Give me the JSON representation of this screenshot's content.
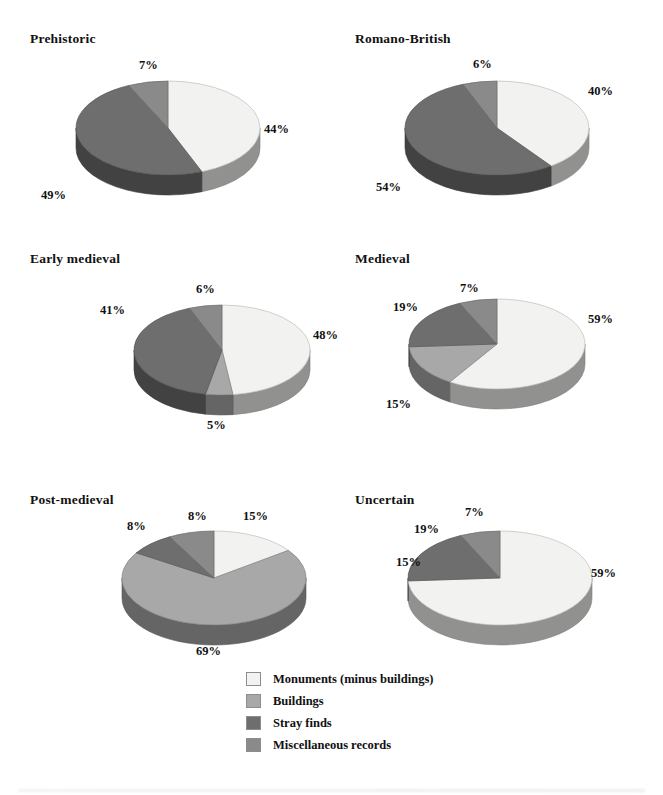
{
  "page": {
    "background": "#ffffff",
    "width": 663,
    "height": 795
  },
  "palette": {
    "monuments": "#f2f2f0",
    "buildings": "#a8a8a8",
    "stray_finds": "#6e6e6e",
    "misc_records": "#8a8a8a",
    "monuments_side": "#6e6e6e",
    "buildings_side": "#8a8a8a",
    "stray_finds_side": "#5a5a5a",
    "misc_side": "#6e6e6e",
    "outline": "#8d8d8d"
  },
  "legend": {
    "name": "chart-legend",
    "items": [
      {
        "label": "Monuments (minus buildings)",
        "color": "#f2f2f0",
        "key": "monuments"
      },
      {
        "label": "Buildings",
        "color": "#a8a8a8",
        "key": "buildings"
      },
      {
        "label": "Stray finds",
        "color": "#6e6e6e",
        "key": "stray_finds"
      },
      {
        "label": "Miscellaneous records",
        "color": "#8a8a8a",
        "key": "misc_records"
      }
    ]
  },
  "chart_data": [
    {
      "type": "pie",
      "title": "Prehistoric",
      "categories": [
        "Monuments (minus buildings)",
        "Buildings",
        "Stray finds",
        "Miscellaneous records"
      ],
      "values": [
        44,
        0,
        49,
        7
      ],
      "labels": [
        "44%",
        null,
        "49%",
        "7%"
      ],
      "legend_position": "bottom-center",
      "notes": "3-D pie, clockwise from 12 o'clock"
    },
    {
      "type": "pie",
      "title": "Romano-British",
      "categories": [
        "Monuments (minus buildings)",
        "Buildings",
        "Stray finds",
        "Miscellaneous records"
      ],
      "values": [
        40,
        0,
        54,
        6
      ],
      "labels": [
        "40%",
        null,
        "54%",
        "6%"
      ],
      "legend_position": "bottom-center",
      "notes": "3-D pie, clockwise from 12 o'clock"
    },
    {
      "type": "pie",
      "title": "Early medieval",
      "categories": [
        "Monuments (minus buildings)",
        "Buildings",
        "Stray finds",
        "Miscellaneous records"
      ],
      "values": [
        48,
        5,
        41,
        6
      ],
      "labels": [
        "48%",
        "5%",
        "41%",
        "6%"
      ],
      "legend_position": "bottom-center",
      "notes": "3-D pie, clockwise from 12 o'clock"
    },
    {
      "type": "pie",
      "title": "Medieval",
      "categories": [
        "Monuments (minus buildings)",
        "Buildings",
        "Stray finds",
        "Miscellaneous records"
      ],
      "values": [
        59,
        15,
        19,
        7
      ],
      "labels": [
        "59%",
        "15%",
        "19%",
        "7%"
      ],
      "legend_position": "bottom-center",
      "notes": "3-D pie, clockwise from 12 o'clock"
    },
    {
      "type": "pie",
      "title": "Post-medieval",
      "categories": [
        "Monuments (minus buildings)",
        "Buildings",
        "Stray finds",
        "Miscellaneous records"
      ],
      "values": [
        15,
        69,
        8,
        8
      ],
      "labels": [
        "15%",
        "69%",
        "8%",
        "8%"
      ],
      "legend_position": "bottom-center",
      "notes": "3-D pie, clockwise from 12 o'clock"
    },
    {
      "type": "pie",
      "title": "Uncertain",
      "categories": [
        "Monuments (minus buildings)",
        "Buildings",
        "Stray finds",
        "Miscellaneous records"
      ],
      "values": [
        59,
        15,
        19,
        7
      ],
      "labels": [
        "59%",
        "15%",
        "19%",
        "7%"
      ],
      "legend_position": "bottom-center",
      "notes": "3-D pie, clockwise from 12 o'clock; large monuments slice sweeps to the left"
    }
  ],
  "charts": [
    {
      "id": "prehistoric",
      "title": "Prehistoric",
      "title_pos": {
        "x": 30,
        "y": 31
      },
      "pie": {
        "cx": 168,
        "cy": 128,
        "rx": 92,
        "ry": 47,
        "depth": 20,
        "start": -90
      },
      "slices": [
        {
          "key": "monuments",
          "pct": 44
        },
        {
          "key": "stray_finds",
          "pct": 49
        },
        {
          "key": "misc_records",
          "pct": 7
        }
      ],
      "pct_labels": [
        {
          "text": "44%",
          "x": 264,
          "y": 122
        },
        {
          "text": "49%",
          "x": 41,
          "y": 188
        },
        {
          "text": "7%",
          "x": 139,
          "y": 58
        }
      ]
    },
    {
      "id": "romano-british",
      "title": "Romano-British",
      "title_pos": {
        "x": 355,
        "y": 31
      },
      "pie": {
        "cx": 497,
        "cy": 128,
        "rx": 92,
        "ry": 47,
        "depth": 20,
        "start": -90
      },
      "slices": [
        {
          "key": "monuments",
          "pct": 40
        },
        {
          "key": "stray_finds",
          "pct": 54
        },
        {
          "key": "misc_records",
          "pct": 6
        }
      ],
      "pct_labels": [
        {
          "text": "40%",
          "x": 588,
          "y": 84
        },
        {
          "text": "54%",
          "x": 376,
          "y": 180
        },
        {
          "text": "6%",
          "x": 473,
          "y": 57
        }
      ]
    },
    {
      "id": "early-medieval",
      "title": "Early medieval",
      "title_pos": {
        "x": 30,
        "y": 251
      },
      "pie": {
        "cx": 222,
        "cy": 350,
        "rx": 88,
        "ry": 45,
        "depth": 20,
        "start": -90
      },
      "slices": [
        {
          "key": "monuments",
          "pct": 48
        },
        {
          "key": "buildings",
          "pct": 5
        },
        {
          "key": "stray_finds",
          "pct": 41
        },
        {
          "key": "misc_records",
          "pct": 6
        }
      ],
      "pct_labels": [
        {
          "text": "48%",
          "x": 313,
          "y": 328
        },
        {
          "text": "5%",
          "x": 207,
          "y": 418
        },
        {
          "text": "41%",
          "x": 100,
          "y": 303
        },
        {
          "text": "6%",
          "x": 196,
          "y": 282
        }
      ]
    },
    {
      "id": "medieval",
      "title": "Medieval",
      "title_pos": {
        "x": 355,
        "y": 251
      },
      "pie": {
        "cx": 497,
        "cy": 344,
        "rx": 88,
        "ry": 45,
        "depth": 20,
        "start": -90
      },
      "slices": [
        {
          "key": "monuments",
          "pct": 59
        },
        {
          "key": "buildings",
          "pct": 15
        },
        {
          "key": "stray_finds",
          "pct": 19
        },
        {
          "key": "misc_records",
          "pct": 7
        }
      ],
      "pct_labels": [
        {
          "text": "59%",
          "x": 588,
          "y": 312
        },
        {
          "text": "15%",
          "x": 386,
          "y": 397
        },
        {
          "text": "19%",
          "x": 393,
          "y": 300
        },
        {
          "text": "7%",
          "x": 460,
          "y": 281
        }
      ]
    },
    {
      "id": "post-medieval",
      "title": "Post-medieval",
      "title_pos": {
        "x": 30,
        "y": 492
      },
      "pie": {
        "cx": 214,
        "cy": 578,
        "rx": 92,
        "ry": 47,
        "depth": 20,
        "start": -90
      },
      "slices": [
        {
          "key": "monuments",
          "pct": 15
        },
        {
          "key": "buildings",
          "pct": 69
        },
        {
          "key": "stray_finds",
          "pct": 8
        },
        {
          "key": "misc_records",
          "pct": 8
        }
      ],
      "pct_labels": [
        {
          "text": "15%",
          "x": 243,
          "y": 509
        },
        {
          "text": "69%",
          "x": 196,
          "y": 644
        },
        {
          "text": "8%",
          "x": 188,
          "y": 509
        },
        {
          "text": "8%",
          "x": 127,
          "y": 519
        }
      ]
    },
    {
      "id": "uncertain",
      "title": "Uncertain",
      "title_pos": {
        "x": 355,
        "y": 492
      },
      "pie": {
        "cx": 500,
        "cy": 578,
        "rx": 92,
        "ry": 47,
        "depth": 20,
        "start": -90
      },
      "slices": [
        {
          "key": "monuments",
          "pct": 74
        },
        {
          "key": "stray_finds",
          "pct": 19
        },
        {
          "key": "misc_records",
          "pct": 7
        }
      ],
      "pct_labels": [
        {
          "text": "59%",
          "x": 591,
          "y": 566
        },
        {
          "text": "15%",
          "x": 396,
          "y": 555
        },
        {
          "text": "19%",
          "x": 414,
          "y": 522
        },
        {
          "text": "7%",
          "x": 465,
          "y": 505
        }
      ]
    }
  ]
}
